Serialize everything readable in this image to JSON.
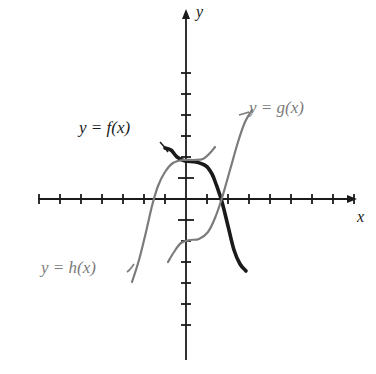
{
  "figure": {
    "type": "function-graph",
    "background_color": "#ffffff",
    "axis_color": "#1a1a1a",
    "bold_curve_color": "#1a1a1a",
    "gray_curve_color": "#7b7b7b"
  },
  "axes": {
    "x_label": "x",
    "y_label": "y",
    "origin_px": {
      "x": 186,
      "y": 199
    },
    "tick_spacing_px": 21,
    "x_ticks_left": 7,
    "x_ticks_right": 8,
    "y_ticks_up": 6,
    "y_ticks_down": 6,
    "x_arrow": true,
    "y_arrow": true,
    "tick_half_length_px": 5,
    "origin_tick_half_length_px": 8
  },
  "labels": {
    "f": "y = f(x)",
    "g": "y = g(x)",
    "h": "y = h(x)"
  },
  "chart_data": {
    "type": "line",
    "title": "",
    "xlabel": "x",
    "ylabel": "y",
    "xlim": [
      -7,
      8
    ],
    "ylim": [
      -6,
      6
    ],
    "grid": false,
    "legend": "inline-curve-labels",
    "series": [
      {
        "name": "y = f(x)",
        "label": "y = f(x)",
        "color": "#1a1a1a",
        "style": "bold",
        "width": 3.6,
        "description": "Bold curve entering from upper left, flattening to a plateau just above the x-axis near y = 1.5, then decreasing steeply through the x-axis at about x = 2.2 and levelling off low on the right.",
        "points_px": [
          [
            165,
            148
          ],
          [
            171,
            150
          ],
          [
            177,
            157
          ],
          [
            185,
            161
          ],
          [
            196,
            162
          ],
          [
            206,
            166
          ],
          [
            212,
            174
          ],
          [
            216,
            184
          ],
          [
            222,
            202
          ],
          [
            228,
            226
          ],
          [
            234,
            250
          ],
          [
            240,
            264
          ],
          [
            246,
            271
          ]
        ]
      },
      {
        "name": "y = g(x)",
        "label": "y = g(x)",
        "color": "#7b7b7b",
        "style": "regular",
        "width": 2.2,
        "description": "Gray S-shaped increasing curve, nearly flat near y = -2 on the left, rising steeply through the x-axis at about x = 2.2 and continuing up to the right.",
        "points_px": [
          [
            168,
            262
          ],
          [
            174,
            252
          ],
          [
            181,
            243
          ],
          [
            190,
            240
          ],
          [
            199,
            239
          ],
          [
            208,
            232
          ],
          [
            215,
            218
          ],
          [
            222,
            198
          ],
          [
            230,
            170
          ],
          [
            238,
            142
          ],
          [
            245,
            122
          ],
          [
            252,
            110
          ]
        ]
      },
      {
        "name": "y = h(x)",
        "label": "y = h(x)",
        "color": "#7b7b7b",
        "style": "regular",
        "width": 2.2,
        "description": "Gray curve rising steeply from the lower left, crossing the x-axis near x = -2.4, bending over to a plateau near y = 1.6 and continuing slightly upward to the right of the y-axis.",
        "points_px": [
          [
            132,
            282
          ],
          [
            139,
            260
          ],
          [
            146,
            232
          ],
          [
            152,
            206
          ],
          [
            158,
            186
          ],
          [
            165,
            172
          ],
          [
            173,
            163
          ],
          [
            183,
            160
          ],
          [
            194,
            160
          ],
          [
            203,
            159
          ],
          [
            210,
            153
          ],
          [
            215,
            147
          ]
        ]
      }
    ]
  }
}
